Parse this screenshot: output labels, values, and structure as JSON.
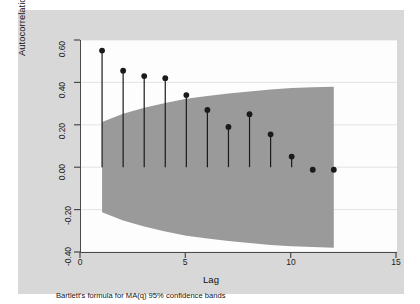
{
  "chart_data": {
    "type": "line",
    "subtype": "stem-acf-with-confidence-band",
    "title": "",
    "xlabel": "Lag",
    "ylabel": "Autocorrelations of ehat",
    "note": "Bartlett's formula for MA(q) 95% confidence bands",
    "xlim": [
      0,
      15
    ],
    "ylim": [
      -0.4,
      0.6
    ],
    "xticks": [
      0,
      5,
      10,
      15
    ],
    "xtick_labels": [
      "0",
      "5",
      "10",
      "15"
    ],
    "yticks": [
      0.6,
      0.4,
      0.2,
      0.0,
      -0.2,
      -0.4
    ],
    "ytick_labels": [
      "0.60",
      "0.40",
      "0.20",
      "0.00",
      "-0.20",
      "-0.40"
    ],
    "grid": "horizontal",
    "legend": "none",
    "x": [
      1,
      2,
      3,
      4,
      5,
      6,
      7,
      8,
      9,
      10,
      11,
      12
    ],
    "series": [
      {
        "name": "Autocorrelations of ehat",
        "values": [
          0.55,
          0.455,
          0.43,
          0.42,
          0.34,
          0.27,
          0.19,
          0.25,
          0.155,
          0.05,
          -0.012,
          -0.012
        ],
        "marker": "filled-circle",
        "color": "#1a1a1a"
      },
      {
        "name": "Bartlett 95% confidence band (upper)",
        "values": [
          0.213,
          0.252,
          0.28,
          0.303,
          0.323,
          0.336,
          0.348,
          0.357,
          0.367,
          0.373,
          0.377,
          0.38
        ],
        "color": "#9a9a9a"
      },
      {
        "name": "Bartlett 95% confidence band (lower)",
        "values": [
          -0.213,
          -0.252,
          -0.28,
          -0.303,
          -0.323,
          -0.336,
          -0.348,
          -0.357,
          -0.367,
          -0.373,
          -0.377,
          -0.38
        ],
        "color": "#9a9a9a"
      }
    ],
    "band_fill_color": "#9a9a9a",
    "plot_background": "#fdfdfd",
    "graph_background": "#d8d8d8",
    "axis_color": "#4a4a4a",
    "gridline_color": "#e3e3e3"
  }
}
